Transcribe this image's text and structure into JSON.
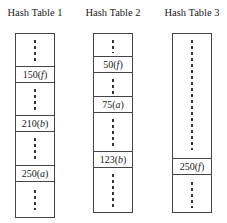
{
  "tables": [
    {
      "title": "Hash Table 1",
      "entries": [
        {
          "key": "150",
          "tag": "f",
          "label": "150(f)"
        },
        {
          "key": "210",
          "tag": "b",
          "label": "210(b)"
        },
        {
          "key": "250",
          "tag": "a",
          "label": "250(a)"
        }
      ]
    },
    {
      "title": "Hash Table 2",
      "entries": [
        {
          "key": "50",
          "tag": "f",
          "label": "50(f)"
        },
        {
          "key": "75",
          "tag": "a",
          "label": "75(a)"
        },
        {
          "key": "123",
          "tag": "b",
          "label": "123(b)"
        }
      ]
    },
    {
      "title": "Hash Table 3",
      "entries": [
        {
          "key": "250",
          "tag": "f",
          "label": "250(f)"
        }
      ]
    }
  ],
  "colors": {
    "border": "#444444",
    "text": "#222222",
    "background": "#ffffff"
  }
}
